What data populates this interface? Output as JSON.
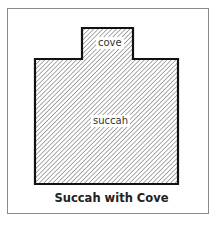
{
  "diagram": {
    "caption": "Succah with Cove",
    "regions": [
      {
        "name": "cove",
        "label": "cove"
      },
      {
        "name": "succah",
        "label": "succah"
      }
    ],
    "colors": {
      "outline": "#111111",
      "hatch": "#555555",
      "frame": "#8a8a8a",
      "background": "#ffffff"
    }
  }
}
